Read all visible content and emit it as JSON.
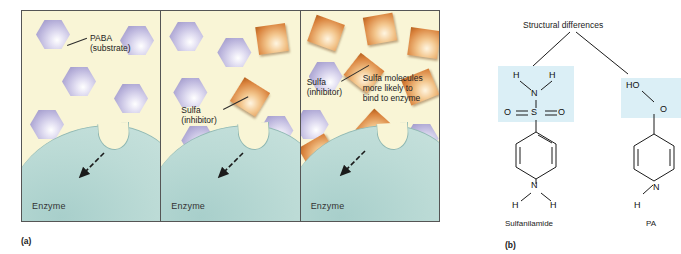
{
  "figure": {
    "part_a_label": "(a)",
    "part_b_label": "(b)"
  },
  "panels": [
    {
      "id": "panel-1",
      "enzyme_label": "Enzyme",
      "callouts": [
        {
          "name": "paba-callout",
          "line1": "PABA",
          "line2": "(substrate)"
        }
      ],
      "hexagons": 9,
      "squares": 0
    },
    {
      "id": "panel-2",
      "enzyme_label": "Enzyme",
      "callouts": [
        {
          "name": "sulfa-callout",
          "line1": "Sulfa",
          "line2": "(inhibitor)"
        }
      ],
      "hexagons": 6,
      "squares": 4
    },
    {
      "id": "panel-3",
      "enzyme_label": "Enzyme",
      "callouts": [
        {
          "name": "sulfa-callout",
          "line1": "Sulfa",
          "line2": "(inhibitor)"
        },
        {
          "name": "binding-callout",
          "line1": "Sulfa molecules",
          "line2": "more likely to",
          "line3": "bind to enzyme"
        }
      ],
      "hexagons": 4,
      "squares": 8
    }
  ],
  "chem": {
    "title": "Structural differences",
    "sulfanilamide": {
      "name": "Sulfanilamide",
      "h_left_top": "H",
      "h_right_top": "H",
      "n_top": "N",
      "o_left": "O",
      "s": "S",
      "o_right": "O",
      "n_bottom": "N",
      "h_left_bottom": "H",
      "h_right_bottom": "H"
    },
    "paba": {
      "name": "PA",
      "ho": "HO",
      "o_double": "O",
      "n_bottom": "N",
      "h_left_bottom": "H"
    }
  },
  "colors": {
    "panel_bg": "#f9f5d6",
    "enzyme": "#bcdbd6",
    "paba_molecule": "#8e86bd",
    "sulfa_molecule": "#d9823c",
    "highlight": "#cfeaf3"
  }
}
